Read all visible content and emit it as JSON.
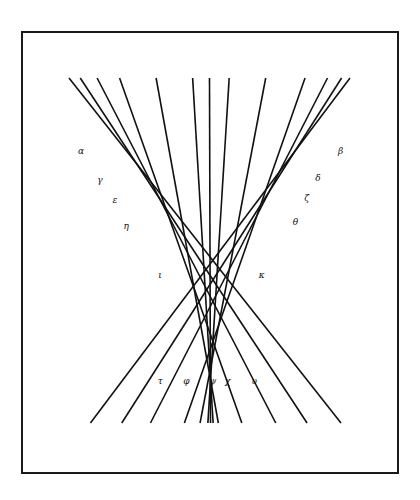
{
  "figure": {
    "line_color": "#111111",
    "lines": [
      {
        "id": "l1",
        "top": 0.0,
        "bottom": 1.0
      },
      {
        "id": "l2",
        "top": 0.04,
        "bottom": 0.87
      },
      {
        "id": "l3",
        "top": 0.1,
        "bottom": 0.75
      },
      {
        "id": "l4",
        "top": 0.18,
        "bottom": 0.62
      },
      {
        "id": "l5",
        "top": 0.31,
        "bottom": 0.53
      },
      {
        "id": "l6",
        "top": 0.44,
        "bottom": 0.51
      },
      {
        "id": "l7",
        "top": 0.5,
        "bottom": 0.5
      },
      {
        "id": "l8",
        "top": 0.57,
        "bottom": 0.49
      },
      {
        "id": "l9",
        "top": 0.7,
        "bottom": 0.46
      },
      {
        "id": "l10",
        "top": 0.84,
        "bottom": 0.4
      },
      {
        "id": "l11",
        "top": 0.92,
        "bottom": 0.27
      },
      {
        "id": "l12",
        "top": 0.97,
        "bottom": 0.16
      },
      {
        "id": "l13",
        "top": 1.0,
        "bottom": 0.04
      }
    ],
    "labels": [
      {
        "text": "α",
        "pos": [
          0.16,
          0.28
        ]
      },
      {
        "text": "γ",
        "pos": [
          0.21,
          0.345
        ]
      },
      {
        "text": "ε",
        "pos": [
          0.25,
          0.39
        ]
      },
      {
        "text": "η",
        "pos": [
          0.28,
          0.45
        ]
      },
      {
        "text": "ι",
        "pos": [
          0.37,
          0.56
        ]
      },
      {
        "text": "β",
        "pos": [
          0.85,
          0.28
        ]
      },
      {
        "text": "δ",
        "pos": [
          0.79,
          0.34
        ]
      },
      {
        "text": "ζ",
        "pos": [
          0.76,
          0.385
        ]
      },
      {
        "text": "θ",
        "pos": [
          0.73,
          0.44
        ]
      },
      {
        "text": "κ",
        "pos": [
          0.64,
          0.56
        ]
      },
      {
        "text": "τ",
        "pos": [
          0.37,
          0.8
        ]
      },
      {
        "text": "φ",
        "pos": [
          0.44,
          0.8
        ]
      },
      {
        "text": "ψ",
        "pos": [
          0.51,
          0.8
        ]
      },
      {
        "text": "χ",
        "pos": [
          0.55,
          0.8
        ]
      },
      {
        "text": "υ",
        "pos": [
          0.62,
          0.8
        ]
      }
    ]
  }
}
